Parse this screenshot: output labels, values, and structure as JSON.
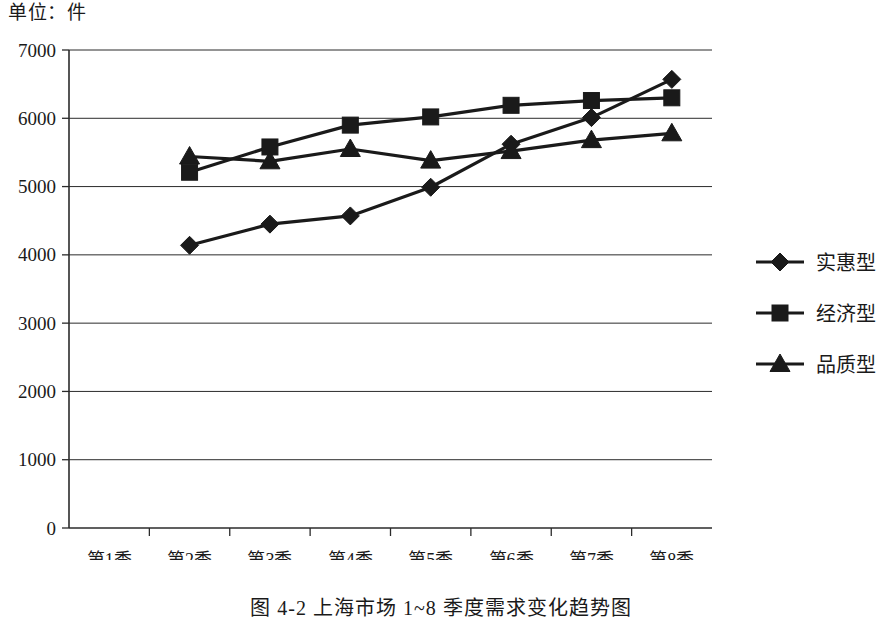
{
  "figure": {
    "unit_label": "单位：件",
    "caption": "图 4-2  上海市场 1~8 季度需求变化趋势图"
  },
  "chart_data": {
    "type": "line",
    "title": "",
    "subtitle": "",
    "xlabel": "",
    "ylabel": "单位：件",
    "categories": [
      "第1季",
      "第2季",
      "第3季",
      "第4季",
      "第5季",
      "第6季",
      "第7季",
      "第8季"
    ],
    "ylim": [
      0,
      7000
    ],
    "ytick_values": [
      0,
      1000,
      2000,
      3000,
      4000,
      5000,
      6000,
      7000
    ],
    "ytick_labels": [
      "0",
      "1000",
      "2000",
      "3000",
      "4000",
      "5000",
      "6000",
      "7000"
    ],
    "grid": "horizontal",
    "legend_position": "right",
    "series": [
      {
        "name": "实惠型",
        "marker": "diamond",
        "color": "#1a1a1a",
        "values": [
          null,
          4140,
          4450,
          4570,
          4990,
          5620,
          6010,
          6570
        ]
      },
      {
        "name": "经济型",
        "marker": "square",
        "color": "#1a1a1a",
        "values": [
          null,
          5210,
          5580,
          5900,
          6020,
          6190,
          6260,
          6300
        ]
      },
      {
        "name": "品质型",
        "marker": "triangle",
        "color": "#1a1a1a",
        "values": [
          null,
          5440,
          5370,
          5550,
          5380,
          5520,
          5680,
          5780
        ]
      }
    ]
  }
}
